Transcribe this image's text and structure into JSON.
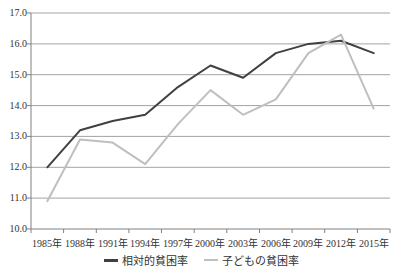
{
  "chart_data": {
    "type": "line",
    "title": "",
    "xlabel": "",
    "ylabel": "",
    "categories": [
      "1985年",
      "1988年",
      "1991年",
      "1994年",
      "1997年",
      "2000年",
      "2003年",
      "2006年",
      "2009年",
      "2012年",
      "2015年"
    ],
    "series": [
      {
        "name": "相対的貧困率",
        "values": [
          12.0,
          13.2,
          13.5,
          13.7,
          14.6,
          15.3,
          14.9,
          15.7,
          16.0,
          16.1,
          15.7
        ]
      },
      {
        "name": "子どもの貧困率",
        "values": [
          10.9,
          12.9,
          12.8,
          12.1,
          13.4,
          14.5,
          13.7,
          14.2,
          15.7,
          16.3,
          13.9
        ]
      }
    ],
    "ylim": [
      10.0,
      17.0
    ],
    "ytick_step": 1.0,
    "ytick_labels": [
      "17.0",
      "16.0",
      "15.0",
      "14.0",
      "13.0",
      "12.0",
      "11.0",
      "10.0"
    ],
    "grid": "horizontal",
    "legend_position": "bottom",
    "series_colors": [
      "#404040",
      "#bfbfbf"
    ],
    "gridline_color": "#a3a3a3",
    "axis_color": "#808080",
    "text_color": "#333333",
    "background_color": "#ffffff"
  }
}
